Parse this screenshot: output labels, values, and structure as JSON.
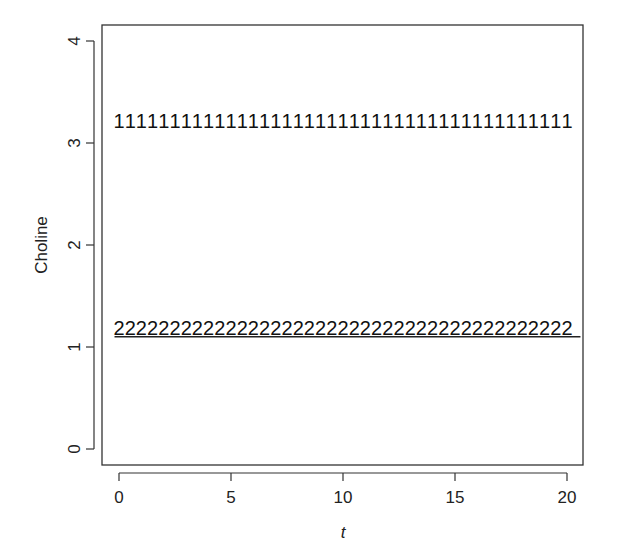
{
  "chart_data": {
    "type": "scatter",
    "title": "",
    "xlabel": "t",
    "ylabel": "Choline",
    "xlim": [
      -0.8,
      20.7
    ],
    "ylim": [
      -0.15,
      4.15
    ],
    "x_ticks": [
      0,
      5,
      10,
      15,
      20
    ],
    "y_ticks": [
      0,
      1,
      2,
      3,
      4
    ],
    "grid": false,
    "legend": null,
    "x": [
      0,
      0.5,
      1,
      1.5,
      2,
      2.5,
      3,
      3.5,
      4,
      4.5,
      5,
      5.5,
      6,
      6.5,
      7,
      7.5,
      8,
      8.5,
      9,
      9.5,
      10,
      10.5,
      11,
      11.5,
      12,
      12.5,
      13,
      13.5,
      14,
      14.5,
      15,
      15.5,
      16,
      16.5,
      17,
      17.5,
      18,
      18.5,
      19,
      19.5,
      20
    ],
    "series": [
      {
        "name": "1",
        "marker": "1",
        "value": 3.2,
        "values": [
          3.2,
          3.2,
          3.2,
          3.2,
          3.2,
          3.2,
          3.2,
          3.2,
          3.2,
          3.2,
          3.2,
          3.2,
          3.2,
          3.2,
          3.2,
          3.2,
          3.2,
          3.2,
          3.2,
          3.2,
          3.2,
          3.2,
          3.2,
          3.2,
          3.2,
          3.2,
          3.2,
          3.2,
          3.2,
          3.2,
          3.2,
          3.2,
          3.2,
          3.2,
          3.2,
          3.2,
          3.2,
          3.2,
          3.2,
          3.2,
          3.2
        ]
      },
      {
        "name": "2",
        "marker": "2",
        "value": 1.17,
        "values": [
          1.17,
          1.17,
          1.17,
          1.17,
          1.17,
          1.17,
          1.17,
          1.17,
          1.17,
          1.17,
          1.17,
          1.17,
          1.17,
          1.17,
          1.17,
          1.17,
          1.17,
          1.17,
          1.17,
          1.17,
          1.17,
          1.17,
          1.17,
          1.17,
          1.17,
          1.17,
          1.17,
          1.17,
          1.17,
          1.17,
          1.17,
          1.17,
          1.17,
          1.17,
          1.17,
          1.17,
          1.17,
          1.17,
          1.17,
          1.17,
          1.17
        ]
      }
    ],
    "lines": [
      {
        "name": "reference-line",
        "y": 1.1,
        "x_from": -0.2,
        "x_to": 20.6
      }
    ]
  }
}
